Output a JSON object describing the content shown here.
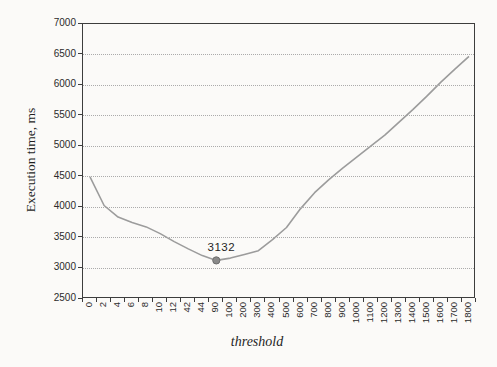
{
  "chart_data": {
    "type": "line",
    "xlabel": "threshold",
    "ylabel": "Execution time, ms",
    "categories": [
      "0",
      "2",
      "4",
      "6",
      "8",
      "10",
      "12",
      "42",
      "44",
      "90",
      "100",
      "200",
      "300",
      "400",
      "500",
      "600",
      "700",
      "800",
      "900",
      "1000",
      "1100",
      "1200",
      "1300",
      "1400",
      "1500",
      "1600",
      "1700",
      "1800"
    ],
    "values": [
      4500,
      4030,
      3840,
      3750,
      3680,
      3570,
      3440,
      3320,
      3210,
      3132,
      3170,
      3230,
      3290,
      3470,
      3670,
      3980,
      4240,
      4450,
      4640,
      4820,
      5000,
      5180,
      5390,
      5600,
      5820,
      6050,
      6260,
      6470
    ],
    "ylim": [
      2500,
      7000
    ],
    "yticks": [
      2500,
      3000,
      3500,
      4000,
      4500,
      5000,
      5500,
      6000,
      6500,
      7000
    ],
    "grid": "horizontal-dotted",
    "legend": "none",
    "marked_point": {
      "category": "90",
      "value": 3132,
      "label": "3132"
    },
    "colors": {
      "line": "#9c9c9c",
      "marker_fill": "#8a8a8a",
      "marker_stroke": "#6e6e6e",
      "axis": "#3d3d3d",
      "gridline": "#ababab",
      "text": "#2b2b2b"
    }
  }
}
